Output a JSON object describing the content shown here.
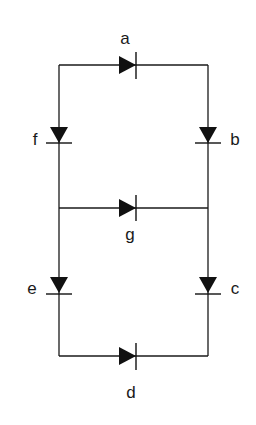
{
  "diagram": {
    "type": "diode-network",
    "nodes": {
      "top_left": [
        59,
        65
      ],
      "top_right": [
        208,
        65
      ],
      "mid_left": [
        59,
        208
      ],
      "mid_right": [
        208,
        208
      ],
      "bot_left": [
        59,
        356
      ],
      "bot_right": [
        208,
        356
      ]
    },
    "diodes": [
      {
        "id": "a",
        "label": "a",
        "from": "top_left",
        "to": "top_right",
        "direction": "right"
      },
      {
        "id": "b",
        "label": "b",
        "from": "top_right",
        "to": "mid_right",
        "direction": "down"
      },
      {
        "id": "c",
        "label": "c",
        "from": "mid_right",
        "to": "bot_right",
        "direction": "down"
      },
      {
        "id": "d",
        "label": "d",
        "from": "bot_left",
        "to": "bot_right",
        "direction": "right"
      },
      {
        "id": "e",
        "label": "e",
        "from": "mid_left",
        "to": "bot_left",
        "direction": "down"
      },
      {
        "id": "f",
        "label": "f",
        "from": "top_left",
        "to": "mid_left",
        "direction": "down"
      },
      {
        "id": "g",
        "label": "g",
        "from": "mid_left",
        "to": "mid_right",
        "direction": "right"
      }
    ]
  },
  "labels": {
    "a": "a",
    "b": "b",
    "c": "c",
    "d": "d",
    "e": "e",
    "f": "f",
    "g": "g"
  },
  "colors": {
    "line": "#1a1a1a",
    "background": "#ffffff"
  }
}
